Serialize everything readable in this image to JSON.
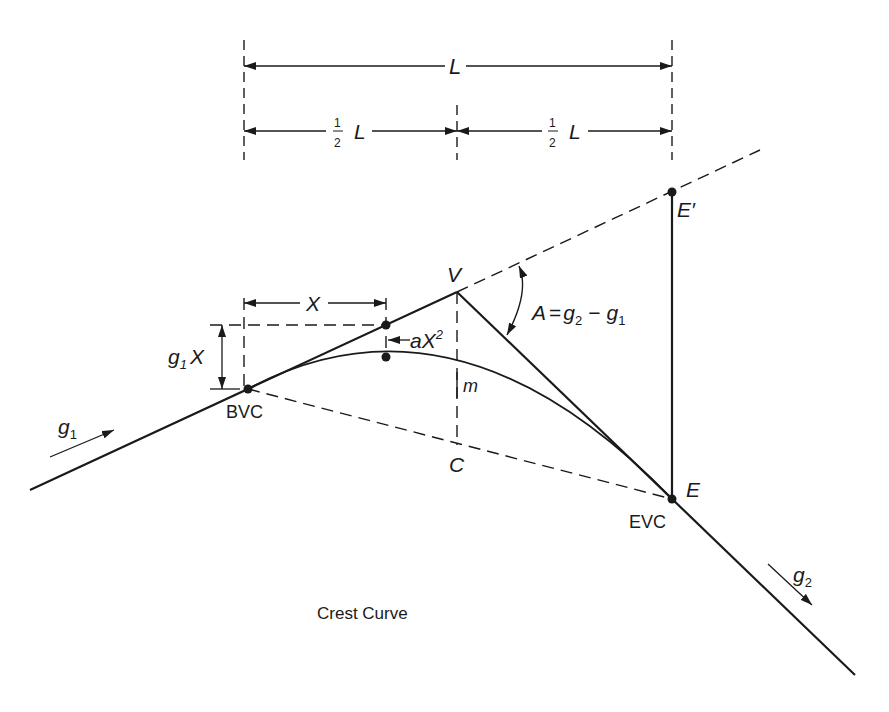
{
  "figure": {
    "caption": "Crest Curve",
    "colors": {
      "ink": "#1a1a1a",
      "background": "#ffffff"
    }
  },
  "dimensions": {
    "total_length_label": "L",
    "half_left_num": "1",
    "half_left_den": "2",
    "half_left_var": "L",
    "half_right_num": "1",
    "half_right_den": "2",
    "half_right_var": "L",
    "offset_x_label": "X",
    "vertical_rise_label": "g",
    "vertical_rise_sub": "1",
    "vertical_rise_var": "X",
    "tangent_offset_label": "aX",
    "tangent_offset_sup": "2"
  },
  "points": {
    "bvc": "BVC",
    "evc": "EVC",
    "v": "V",
    "c": "C",
    "m": "m",
    "e": "E",
    "e_prime": "E′"
  },
  "grades": {
    "g1_label": "g",
    "g1_sub": "1",
    "g2_label": "g",
    "g2_sub": "2",
    "angle_lhs": "A",
    "angle_eq": "=",
    "angle_g2": "g",
    "angle_g2_sub": "2",
    "angle_minus": "−",
    "angle_g1": "g",
    "angle_g1_sub": "1"
  }
}
